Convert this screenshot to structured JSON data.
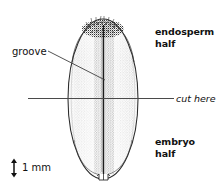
{
  "figure": {
    "kind": "seed-cross-section-diagram",
    "background_color": "#ffffff",
    "ink_color": "#111111",
    "stipple_color": "#8d8d8d",
    "line_color": "#4a4a4a"
  },
  "labels": {
    "endosperm_half": "endosperm\nhalf",
    "embryo_half": "embryo\nhalf",
    "cut_here": "cut here",
    "groove": "groove",
    "scale": "1 mm"
  },
  "annotations": {
    "cut_line": {
      "name": "cut-here-line",
      "x1": 28,
      "y1": 98.5,
      "x2": 174,
      "y2": 98.5
    },
    "groove_leader": {
      "name": "groove-leader-line",
      "x1": 48,
      "y1": 51,
      "x2": 105,
      "y2": 80
    },
    "scale_bar": {
      "name": "scale-bar-arrow",
      "x": 14,
      "y_top": 160,
      "y_bottom": 176,
      "value": "1 mm"
    }
  },
  "seed": {
    "name": "seed-outline",
    "center_x": 103,
    "center_y": 99,
    "radius_x": 35,
    "radius_y": 80,
    "groove_x": 103.5,
    "groove_top": 24,
    "groove_bottom": 176,
    "crown_center_x": 103,
    "crown_center_y": 28,
    "crown_radius_x": 20,
    "crown_radius_y": 8,
    "hilum_x": 103,
    "hilum_y": 178
  }
}
